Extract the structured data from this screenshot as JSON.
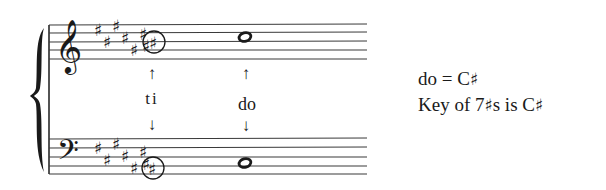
{
  "figure": {
    "key_signature": {
      "sharps": 7,
      "sharp_symbol": "♯"
    },
    "notes": {
      "treble_ti": {
        "syllable": "ti",
        "pitch": "B♯",
        "circled": true
      },
      "treble_do": {
        "syllable": "do",
        "pitch": "C♯"
      },
      "bass_ti": {
        "syllable": "ti",
        "pitch": "B♯",
        "circled": true
      },
      "bass_do": {
        "syllable": "do",
        "pitch": "C♯"
      }
    },
    "labels": {
      "ti": "ti",
      "do": "do",
      "arrow_up": "↑",
      "arrow_down": "↓"
    },
    "clefs": {
      "treble": "treble-clef",
      "bass": "bass-clef"
    }
  },
  "caption": {
    "line1_prefix": "do = C",
    "line1_sharp": "♯",
    "line2_prefix": "Key of 7",
    "line2_sharp": "♯",
    "line2_middle": "s is C",
    "line2_end_sharp": "♯"
  }
}
